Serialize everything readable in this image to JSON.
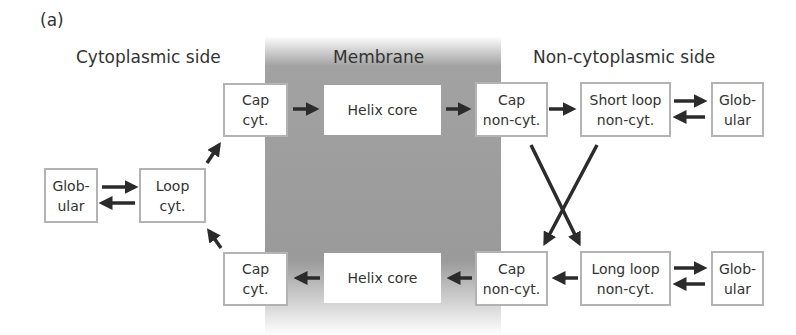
{
  "panel_label": "(a)",
  "regions": {
    "cytoplasmic": "Cytoplasmic side",
    "membrane": "Membrane",
    "non_cytoplasmic": "Non-cytoplasmic side"
  },
  "colors": {
    "membrane_gray": "#9a9a9a",
    "box_border": "#b3b3b3",
    "arrow": "#2b2b2b"
  },
  "nodes": {
    "glob_left": {
      "line1": "Glob-",
      "line2": "ular"
    },
    "loop_cyt": {
      "line1": "Loop",
      "line2": "cyt."
    },
    "cap_cyt_top": {
      "line1": "Cap",
      "line2": "cyt."
    },
    "helix_core_top": {
      "line1": "Helix core"
    },
    "cap_noncyt_top": {
      "line1": "Cap",
      "line2": "non-cyt."
    },
    "short_loop": {
      "line1": "Short loop",
      "line2": "non-cyt."
    },
    "glob_right_top": {
      "line1": "Glob-",
      "line2": "ular"
    },
    "cap_cyt_bottom": {
      "line1": "Cap",
      "line2": "cyt."
    },
    "helix_core_bottom": {
      "line1": "Helix core"
    },
    "cap_noncyt_bottom": {
      "line1": "Cap",
      "line2": "non-cyt."
    },
    "long_loop": {
      "line1": "Long loop",
      "line2": "non-cyt."
    },
    "glob_right_bottom": {
      "line1": "Glob-",
      "line2": "ular"
    }
  },
  "edges": [
    {
      "from": "glob_left",
      "to": "loop_cyt"
    },
    {
      "from": "loop_cyt",
      "to": "glob_left"
    },
    {
      "from": "loop_cyt",
      "to": "cap_cyt_top"
    },
    {
      "from": "cap_cyt_top",
      "to": "helix_core_top"
    },
    {
      "from": "helix_core_top",
      "to": "cap_noncyt_top"
    },
    {
      "from": "cap_noncyt_top",
      "to": "short_loop"
    },
    {
      "from": "short_loop",
      "to": "glob_right_top"
    },
    {
      "from": "glob_right_top",
      "to": "short_loop"
    },
    {
      "from": "cap_noncyt_top",
      "to": "long_loop"
    },
    {
      "from": "short_loop",
      "to": "cap_noncyt_bottom"
    },
    {
      "from": "long_loop",
      "to": "glob_right_bottom"
    },
    {
      "from": "glob_right_bottom",
      "to": "long_loop"
    },
    {
      "from": "long_loop",
      "to": "cap_noncyt_bottom"
    },
    {
      "from": "cap_noncyt_bottom",
      "to": "helix_core_bottom"
    },
    {
      "from": "helix_core_bottom",
      "to": "cap_cyt_bottom"
    },
    {
      "from": "cap_cyt_bottom",
      "to": "loop_cyt"
    }
  ]
}
